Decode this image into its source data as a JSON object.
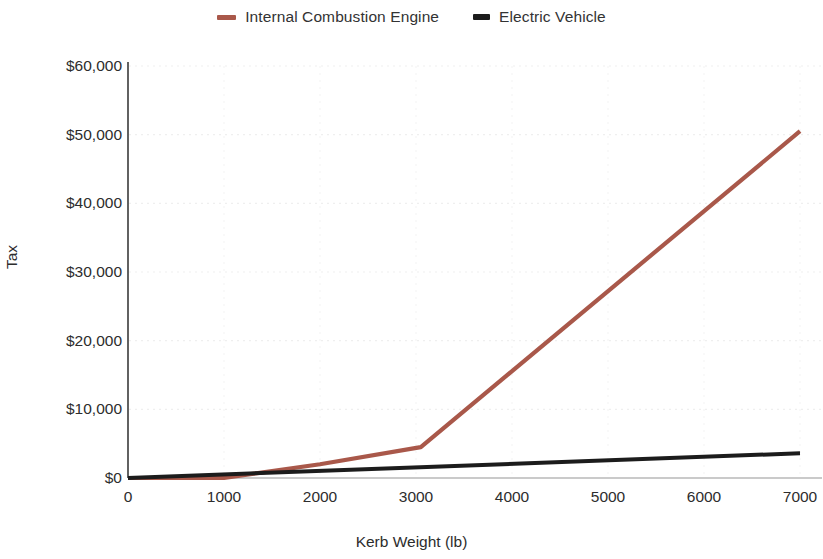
{
  "chart_data": {
    "type": "line",
    "title": "",
    "xlabel": "Kerb Weight (lb)",
    "ylabel": "Tax",
    "xlim": [
      0,
      7000
    ],
    "ylim": [
      0,
      60000
    ],
    "xticks": [
      0,
      1000,
      2000,
      3000,
      4000,
      5000,
      6000,
      7000
    ],
    "xticklabels": [
      "0",
      "1000",
      "2000",
      "3000",
      "4000",
      "5000",
      "6000",
      "7000"
    ],
    "yticks": [
      0,
      10000,
      20000,
      30000,
      40000,
      50000,
      60000
    ],
    "yticklabels": [
      "$0",
      "$10,000",
      "$20,000",
      "$30,000",
      "$40,000",
      "$50,000",
      "$60,000"
    ],
    "grid": "horizontal-dotted-faint",
    "legend_position": "top-center",
    "series": [
      {
        "name": "Internal Combustion Engine",
        "color": "#a9584a",
        "x": [
          0,
          1000,
          2000,
          3050,
          7000
        ],
        "values": [
          0,
          0,
          2000,
          4500,
          50500
        ]
      },
      {
        "name": "Electric Vehicle",
        "color": "#1c1c1c",
        "x": [
          0,
          7000
        ],
        "values": [
          0,
          3600
        ]
      }
    ]
  },
  "legend": {
    "entries": [
      {
        "label": "Internal Combustion Engine"
      },
      {
        "label": "Electric Vehicle"
      }
    ]
  },
  "axes": {
    "y_title": "Tax",
    "x_title": "Kerb Weight (lb)"
  },
  "colors": {
    "ice": "#a9584a",
    "ev": "#1c1c1c",
    "axis": "#3a3a3a",
    "grid": "#efefef",
    "background": "#ffffff"
  }
}
